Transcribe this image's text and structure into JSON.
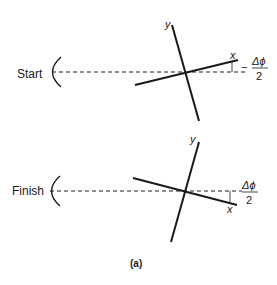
{
  "figure": {
    "caption": "(a)",
    "panels": [
      {
        "id": "start",
        "label": "Start",
        "y_axis_label": "y",
        "x_axis_label": "x",
        "angle_numerator": "Δϕ",
        "angle_denominator": "2",
        "angle_sign": "−"
      },
      {
        "id": "finish",
        "label": "Finish",
        "y_axis_label": "y",
        "x_axis_label": "x",
        "angle_numerator": "Δϕ",
        "angle_denominator": "2",
        "angle_sign": ""
      }
    ]
  },
  "colors": {
    "line": "#1a1a1a",
    "background": "#ffffff"
  }
}
